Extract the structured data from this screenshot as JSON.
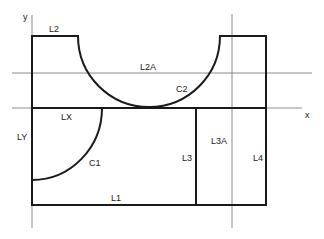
{
  "diagram": {
    "colors": {
      "background": "#ffffff",
      "outline": "#1a1a1a",
      "axis": "#6e6e6e"
    },
    "axes": {
      "x_label": "x",
      "y_label": "y"
    },
    "labels": {
      "L2": "L2",
      "L2A": "L2A",
      "C2": "C2",
      "LX": "LX",
      "LY": "LY",
      "C1": "C1",
      "L1": "L1",
      "L3": "L3",
      "L3A": "L3A",
      "L4": "L4"
    }
  }
}
